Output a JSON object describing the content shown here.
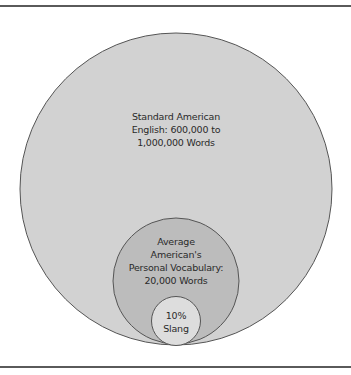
{
  "diagram": {
    "type": "nested-circles",
    "circles": [
      {
        "id": "standard-english",
        "lines": [
          "Standard American",
          "English: 600,000 to",
          "1,000,000 Words"
        ],
        "fill": "#d2d2d2"
      },
      {
        "id": "personal-vocabulary",
        "lines": [
          "Average",
          "American's",
          "Personal Vocabulary:",
          "20,000 Words"
        ],
        "fill": "#bcbcbc"
      },
      {
        "id": "slang",
        "lines": [
          "10%",
          "Slang"
        ],
        "fill": "#dddddd"
      }
    ],
    "stroke": "#555555"
  }
}
